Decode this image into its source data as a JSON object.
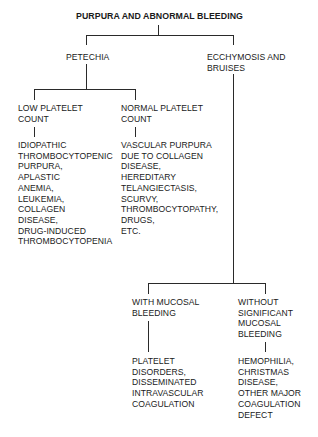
{
  "diagram": {
    "title": "PURPURA AND ABNORMAL BLEEDING",
    "nodes": {
      "petechia": "PETECHIA",
      "ecchymosis": "ECCHYMOSIS AND\nBRUISES",
      "low_platelet": "LOW PLATELET\nCOUNT",
      "normal_platelet": "NORMAL PLATELET\nCOUNT",
      "low_platelet_causes": "IDIOPATHIC\nTHROMBOCYTOPENIC\nPURPURA,\nAPLASTIC\nANEMIA,\nLEUKEMIA,\nCOLLAGEN\nDISEASE,\nDRUG-INDUCED\nTHROMBOCYTOPENIA",
      "normal_platelet_causes": "VASCULAR PURPURA\nDUE TO COLLAGEN\nDISEASE,\nHEREDITARY\nTELANGIECTASIS,\nSCURVY,\nTHROMBOCYTOPATHY,\nDRUGS,\nETC.",
      "with_mucosal": "WITH MUCOSAL\nBLEEDING",
      "without_mucosal": "WITHOUT\nSIGNIFICANT\nMUCOSAL\nBLEEDING",
      "with_mucosal_causes": "PLATELET\nDISORDERS,\nDISSEMINATED\nINTRAVASCULAR\nCOAGULATION",
      "without_mucosal_causes": "HEMOPHILIA,\nCHRISTMAS\nDISEASE,\nOTHER MAJOR\nCOAGULATION\nDEFECT"
    }
  }
}
